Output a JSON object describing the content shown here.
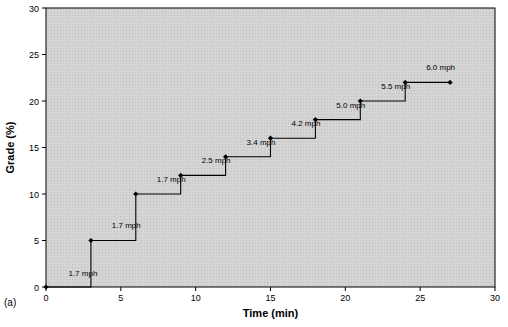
{
  "chart_data": {
    "type": "line",
    "title": "",
    "xlabel": "Time (min)",
    "ylabel": "Grade (%)",
    "xlim": [
      0,
      30
    ],
    "ylim": [
      0,
      30
    ],
    "xticks": [
      0,
      5,
      10,
      15,
      20,
      25,
      30
    ],
    "yticks": [
      0,
      5,
      10,
      15,
      20,
      25,
      30
    ],
    "grid": false,
    "legend": "none",
    "plot_background": "#d4d4d4",
    "line_color": "#000000",
    "series": [
      {
        "name": "Grade vs Time (Bruce protocol staircase)",
        "x": [
          0,
          3,
          3,
          6,
          6,
          9,
          9,
          12,
          12,
          15,
          15,
          18,
          18,
          21,
          21,
          24,
          24,
          27
        ],
        "y": [
          0,
          0,
          5,
          5,
          10,
          10,
          12,
          12,
          14,
          14,
          16,
          16,
          18,
          18,
          20,
          20,
          22,
          22
        ]
      }
    ],
    "markers": [
      {
        "x": 0,
        "y": 0
      },
      {
        "x": 3,
        "y": 5
      },
      {
        "x": 6,
        "y": 10
      },
      {
        "x": 9,
        "y": 12
      },
      {
        "x": 12,
        "y": 14
      },
      {
        "x": 15,
        "y": 16
      },
      {
        "x": 18,
        "y": 18
      },
      {
        "x": 21,
        "y": 20
      },
      {
        "x": 24,
        "y": 22
      },
      {
        "x": 27,
        "y": 22
      }
    ],
    "annotations": [
      {
        "text": "1.7 mph",
        "x": 1.5,
        "y": 1.2
      },
      {
        "text": "1.7 mph",
        "x": 4.4,
        "y": 6.3
      },
      {
        "text": "1.7 mph",
        "x": 7.4,
        "y": 11.3
      },
      {
        "text": "2.5 mph",
        "x": 10.4,
        "y": 13.3
      },
      {
        "text": "3.4 mph",
        "x": 13.4,
        "y": 15.3
      },
      {
        "text": "4.2 mph",
        "x": 16.4,
        "y": 17.3
      },
      {
        "text": "5.0 mph",
        "x": 19.4,
        "y": 19.3
      },
      {
        "text": "5.5 mph",
        "x": 22.4,
        "y": 21.3
      },
      {
        "text": "6.0 mph",
        "x": 25.4,
        "y": 23.3
      }
    ]
  },
  "figure": {
    "panel_label": "(a)"
  }
}
